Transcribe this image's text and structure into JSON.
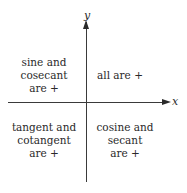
{
  "axes": {
    "x_label": "x",
    "y_label": "y"
  },
  "quadrants": {
    "q1": "all are +",
    "q2": "sine and\ncosecant\nare +",
    "q3": "tangent and\ncotangent\nare +",
    "q4": "cosine and\nsecant\nare +"
  },
  "colors": {
    "axis": "#3a3a3a",
    "text": "#2a2a2a",
    "background": "#ffffff"
  }
}
